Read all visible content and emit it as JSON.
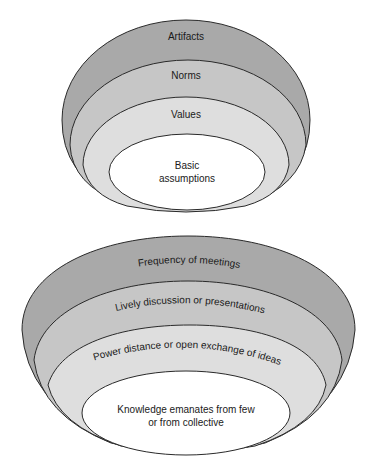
{
  "top_diagram": {
    "layers": [
      {
        "label": "Artifacts",
        "fill": "#a9a9a9"
      },
      {
        "label": "Norms",
        "fill": "#c6c6c6"
      },
      {
        "label": "Values",
        "fill": "#dedede"
      },
      {
        "label_line1": "Basic",
        "label_line2": "assumptions",
        "fill": "#ffffff"
      }
    ]
  },
  "bottom_diagram": {
    "layers": [
      {
        "label": "Frequency of meetings",
        "fill": "#a9a9a9"
      },
      {
        "label": "Lively discussion or presentations",
        "fill": "#c6c6c6"
      },
      {
        "label": "Power distance or open exchange of ideas",
        "fill": "#dedede"
      },
      {
        "label_line1": "Knowledge emanates from few",
        "label_line2": "or from collective",
        "fill": "#ffffff"
      }
    ]
  },
  "colors": {
    "stroke": "#2a2a2a",
    "background": "#ffffff"
  }
}
